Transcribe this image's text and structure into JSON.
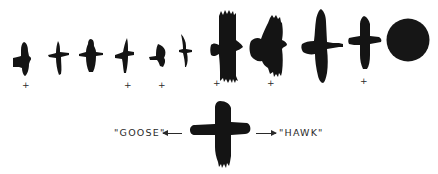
{
  "figure": {
    "ink_color": "#141414",
    "background": "#ffffff",
    "silhouettes": [
      {
        "id": 1,
        "kind": "small-bird",
        "marked": true
      },
      {
        "id": 2,
        "kind": "small-bird",
        "marked": false
      },
      {
        "id": 3,
        "kind": "small-bird",
        "marked": false
      },
      {
        "id": 4,
        "kind": "small-bird",
        "marked": true
      },
      {
        "id": 5,
        "kind": "small-bird",
        "marked": true
      },
      {
        "id": 6,
        "kind": "slender-bird",
        "marked": false
      },
      {
        "id": 7,
        "kind": "large-raptor",
        "marked": true
      },
      {
        "id": 8,
        "kind": "large-raptor-banking",
        "marked": true
      },
      {
        "id": 9,
        "kind": "long-neck-bird",
        "marked": false
      },
      {
        "id": 10,
        "kind": "model-bird",
        "marked": true
      },
      {
        "id": 11,
        "kind": "circle",
        "marked": false
      }
    ],
    "marker_symbol": "+",
    "bottom_model": {
      "left_label": "\"GOOSE\"",
      "right_label": "\"HAWK\"",
      "left_arrow": "←",
      "right_arrow": "→"
    }
  }
}
